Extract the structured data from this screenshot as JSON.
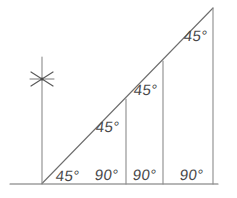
{
  "figure": {
    "title": "",
    "type": "geometry-diagram",
    "canvas": {
      "width": 237,
      "height": 198
    },
    "style": {
      "background": "#ffffff",
      "stroke_color": "#6e6e6e",
      "label_color": "#4a4a4a",
      "stroke_width": 1
    },
    "lines": {
      "baseline": {
        "name": "horizontal-base-line",
        "x1": 10,
        "y1": 184,
        "x2": 218,
        "y2": 184
      },
      "hypotenuse": {
        "name": "diagonal-hypotenuse-line",
        "x1": 42,
        "y1": 183,
        "x2": 213,
        "y2": 8
      },
      "verticals": [
        {
          "name": "vertical-line-left",
          "x": 42,
          "y_top": 57,
          "y_bottom": 184
        },
        {
          "name": "vertical-line-middle-left",
          "x": 126,
          "y_top": 99,
          "y_bottom": 184
        },
        {
          "name": "vertical-line-middle-right",
          "x": 163,
          "y_top": 61,
          "y_bottom": 184
        },
        {
          "name": "vertical-line-right",
          "x": 213,
          "y_top": 8,
          "y_bottom": 184
        }
      ]
    },
    "tick_mark": {
      "name": "star-tick-mark",
      "cx": 42,
      "cy": 79,
      "radius": 13,
      "spokes": 3
    },
    "labels": [
      {
        "id": "angle-vertex-45",
        "text": "45°",
        "x": 56,
        "y": 168,
        "angle_value": 45,
        "kind": "base-angle"
      },
      {
        "id": "angle-base-right-90-1",
        "text": "90°",
        "x": 95,
        "y": 167,
        "angle_value": 90,
        "kind": "right-angle"
      },
      {
        "id": "angle-diagonal-45-1",
        "text": "45°",
        "x": 96,
        "y": 119,
        "angle_value": 45,
        "kind": "apex-angle"
      },
      {
        "id": "angle-base-right-90-2",
        "text": "90°",
        "x": 133,
        "y": 167,
        "angle_value": 90,
        "kind": "right-angle"
      },
      {
        "id": "angle-diagonal-45-2",
        "text": "45°",
        "x": 134,
        "y": 82,
        "angle_value": 45,
        "kind": "apex-angle"
      },
      {
        "id": "angle-base-right-90-3",
        "text": "90°",
        "x": 180,
        "y": 167,
        "angle_value": 90,
        "kind": "right-angle"
      },
      {
        "id": "angle-diagonal-45-3",
        "text": "45°",
        "x": 184,
        "y": 28,
        "angle_value": 45,
        "kind": "apex-angle"
      }
    ]
  }
}
